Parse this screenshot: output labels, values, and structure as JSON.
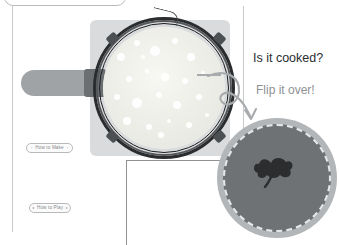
{
  "scene": {
    "title_bar": {
      "name": "top-rounded-bar"
    },
    "callouts": {
      "question": "Is it cooked?",
      "instruction": "Flip it over!"
    },
    "buttons": [
      {
        "id": "how-to-make",
        "label": "How to Make",
        "left_marker": "‹",
        "right_marker": "›"
      },
      {
        "id": "how-to-play",
        "label": "How to Play",
        "left_marker": "◂",
        "right_marker": "▸"
      }
    ],
    "pan": {
      "name": "frying-pan",
      "plate_color": "#d9dbdc",
      "handle_color": "#9fa3a5",
      "rim_color": "#2a2c2e",
      "batter_color": "#efefea",
      "bubble_color": "#ffffff",
      "bubbles": [
        {
          "x": 18,
          "y": 30,
          "r": 4
        },
        {
          "x": 34,
          "y": 16,
          "r": 3
        },
        {
          "x": 52,
          "y": 24,
          "r": 5
        },
        {
          "x": 72,
          "y": 14,
          "r": 3
        },
        {
          "x": 88,
          "y": 30,
          "r": 4
        },
        {
          "x": 26,
          "y": 52,
          "r": 3
        },
        {
          "x": 44,
          "y": 44,
          "r": 2
        },
        {
          "x": 62,
          "y": 50,
          "r": 4
        },
        {
          "x": 82,
          "y": 54,
          "r": 3
        },
        {
          "x": 100,
          "y": 46,
          "r": 2
        },
        {
          "x": 14,
          "y": 70,
          "r": 3
        },
        {
          "x": 34,
          "y": 76,
          "r": 5
        },
        {
          "x": 56,
          "y": 68,
          "r": 3
        },
        {
          "x": 74,
          "y": 78,
          "r": 4
        },
        {
          "x": 96,
          "y": 70,
          "r": 3
        },
        {
          "x": 24,
          "y": 94,
          "r": 4
        },
        {
          "x": 46,
          "y": 100,
          "r": 3
        },
        {
          "x": 66,
          "y": 94,
          "r": 2
        },
        {
          "x": 86,
          "y": 98,
          "r": 3
        },
        {
          "x": 40,
          "y": 30,
          "r": 2
        },
        {
          "x": 104,
          "y": 88,
          "r": 2
        },
        {
          "x": 58,
          "y": 108,
          "r": 3
        }
      ]
    },
    "cooked_pancake": {
      "name": "cooked-pancake",
      "edge_color": "#b3b6b8",
      "surface_color": "#6f7275",
      "mark_color": "#2b2d2f"
    },
    "flip_arrow": {
      "name": "flip-arrow",
      "color": "#a8abad"
    },
    "guides": {
      "rule_color": "#c9cccd",
      "frame_color": "#8f9396"
    }
  }
}
